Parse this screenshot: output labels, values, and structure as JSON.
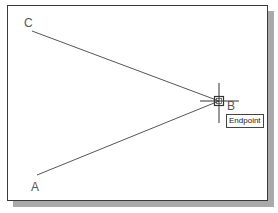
{
  "drawing": {
    "points": [
      {
        "id": "C",
        "label": "C",
        "x": 24,
        "y": 17
      },
      {
        "id": "A",
        "label": "A",
        "x": 31,
        "y": 181
      },
      {
        "id": "B",
        "label": "B",
        "x": 227,
        "y": 100
      }
    ],
    "lines": [
      {
        "from": "C",
        "to": "B"
      },
      {
        "from": "A",
        "to": "B"
      }
    ],
    "colors": {
      "line": "#555555",
      "frame": "#3a3a3a",
      "shadow": "#a9a9a9",
      "background": "#ffffff"
    }
  },
  "cursor": {
    "type": "crosshair",
    "snap_marker": "endpoint-square",
    "x": 219,
    "y": 101
  },
  "osnap_tooltip": {
    "text": "Endpoint"
  }
}
